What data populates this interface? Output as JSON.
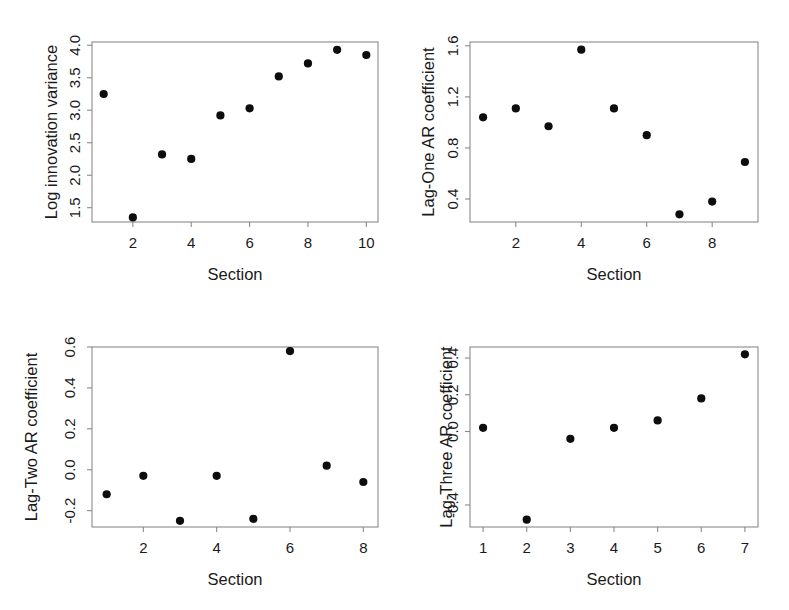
{
  "figure": {
    "background_color": "#ffffff",
    "point_color": "#0d0d0d",
    "axis_color": "#8a8a8a",
    "panel_count": 4,
    "layout": "2x2 grid of scatter panels"
  },
  "chart_data": [
    {
      "type": "scatter",
      "title": "",
      "xlabel": "Section",
      "ylabel": "Log innovation variance",
      "x": [
        1,
        2,
        3,
        4,
        5,
        6,
        7,
        8,
        9,
        10
      ],
      "values": [
        3.25,
        1.35,
        2.32,
        2.25,
        2.92,
        3.03,
        3.52,
        3.72,
        3.93,
        3.85
      ],
      "xticks": [
        2,
        4,
        6,
        8,
        10
      ],
      "xticklabels": [
        "2",
        "4",
        "6",
        "8",
        "10"
      ],
      "yticks": [
        1.5,
        2.0,
        2.5,
        3.0,
        3.5,
        4.0
      ],
      "yticklabels": [
        "1.5",
        "2.0",
        "2.5",
        "3.0",
        "3.5",
        "4.0"
      ],
      "xlim": [
        0.6,
        10.4
      ],
      "ylim": [
        1.28,
        4.05
      ],
      "grid": false,
      "legend": "none"
    },
    {
      "type": "scatter",
      "title": "",
      "xlabel": "Section",
      "ylabel": "Lag-One AR coefficient",
      "x": [
        1,
        2,
        3,
        4,
        5,
        6,
        7,
        8,
        9
      ],
      "values": [
        1.04,
        1.11,
        0.97,
        1.57,
        1.11,
        0.9,
        0.28,
        0.38,
        0.69
      ],
      "xticks": [
        2,
        4,
        6,
        8
      ],
      "xticklabels": [
        "2",
        "4",
        "6",
        "8"
      ],
      "yticks": [
        0.4,
        0.8,
        1.2,
        1.6
      ],
      "yticklabels": [
        "0.4",
        "0.8",
        "1.2",
        "1.6"
      ],
      "xlim": [
        0.6,
        9.4
      ],
      "ylim": [
        0.22,
        1.63
      ],
      "grid": false,
      "legend": "none"
    },
    {
      "type": "scatter",
      "title": "",
      "xlabel": "Section",
      "ylabel": "Lag-Two AR coefficient",
      "x": [
        1,
        2,
        3,
        4,
        5,
        6,
        7,
        8
      ],
      "values": [
        -0.12,
        -0.03,
        -0.25,
        -0.03,
        -0.24,
        0.58,
        0.02,
        -0.06
      ],
      "xticks": [
        2,
        4,
        6,
        8
      ],
      "xticklabels": [
        "2",
        "4",
        "6",
        "8"
      ],
      "yticks": [
        -0.2,
        0.0,
        0.2,
        0.4,
        0.6
      ],
      "yticklabels": [
        "-0.2",
        "0.0",
        "0.2",
        "0.4",
        "0.6"
      ],
      "xlim": [
        0.6,
        8.4
      ],
      "ylim": [
        -0.28,
        0.6
      ],
      "grid": false,
      "legend": "none"
    },
    {
      "type": "scatter",
      "title": "",
      "xlabel": "Section",
      "ylabel": "Lag-Three AR coefficient",
      "x": [
        1,
        2,
        3,
        4,
        5,
        6,
        7
      ],
      "values": [
        0.02,
        -0.48,
        -0.04,
        0.02,
        0.06,
        0.18,
        0.42
      ],
      "xticks": [
        1,
        2,
        3,
        4,
        5,
        6,
        7
      ],
      "xticklabels": [
        "1",
        "2",
        "3",
        "4",
        "5",
        "6",
        "7"
      ],
      "yticks": [
        -0.4,
        0.0,
        0.2,
        0.4
      ],
      "yticklabels": [
        "-0.4",
        "0.0",
        "0.2",
        "0.4"
      ],
      "xlim": [
        0.7,
        7.3
      ],
      "ylim": [
        -0.52,
        0.46
      ],
      "grid": false,
      "legend": "none"
    }
  ]
}
